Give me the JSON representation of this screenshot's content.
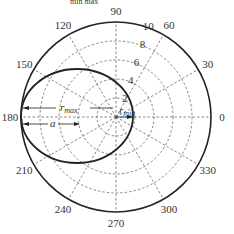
{
  "header_fragment": "min   max",
  "polar": {
    "center": [
      116,
      117
    ],
    "outer_radius": 95,
    "max_r": 10,
    "grid_color": "#555555",
    "line_color": "#222222",
    "angle_labels": [
      "0",
      "30",
      "60",
      "90",
      "120",
      "150",
      "180",
      "210",
      "240",
      "270",
      "300",
      "330"
    ],
    "radial_labels": [
      "2",
      "4",
      "6",
      "8",
      "10"
    ]
  },
  "ellipse": {
    "cx": 77,
    "cy": 116,
    "rx": 56,
    "ry": 47
  },
  "annotations": {
    "r_max": "r",
    "r_max_sub": "max",
    "a": "a",
    "r_min": "r",
    "r_min_sub": "min"
  }
}
